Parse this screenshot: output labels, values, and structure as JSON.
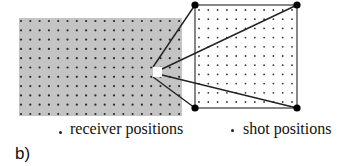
{
  "figure": {
    "panel_label": "b)",
    "legend": {
      "receiver_label": "receiver positions",
      "shot_label": "shot positions"
    },
    "colors": {
      "receiver_area": "#c4c4c4",
      "receiver_dot": "#2a2a2a",
      "shot_dot": "#333333",
      "outline": "#555555",
      "ray": "#222222",
      "corner": "#000000",
      "receiver_marker": "#ffffff"
    },
    "receiver_grid": {
      "rect": {
        "x": 19,
        "y": 18,
        "w": 163,
        "h": 98
      },
      "cols": 18,
      "rows": 11,
      "x0": 21,
      "dx": 9.3,
      "y0": 21,
      "dy": 9.3
    },
    "shot_grid": {
      "square": {
        "x": 195,
        "y": 5,
        "w": 102,
        "h": 103
      },
      "cols": 11,
      "rows": 11,
      "x0": 199,
      "dx": 9.3,
      "y0": 10,
      "dy": 9.2
    },
    "receiver_marker": {
      "x": 153,
      "y": 67,
      "w": 9,
      "h": 10
    },
    "rays": [
      {
        "from": [
          153,
          67
        ],
        "to": [
          195,
          5
        ]
      },
      {
        "from": [
          162,
          69
        ],
        "to": [
          297,
          5
        ]
      },
      {
        "from": [
          153,
          77
        ],
        "to": [
          195,
          108
        ]
      },
      {
        "from": [
          162,
          75
        ],
        "to": [
          297,
          108
        ]
      }
    ],
    "corners": [
      [
        195,
        5
      ],
      [
        297,
        5
      ],
      [
        195,
        108
      ],
      [
        297,
        108
      ]
    ]
  }
}
